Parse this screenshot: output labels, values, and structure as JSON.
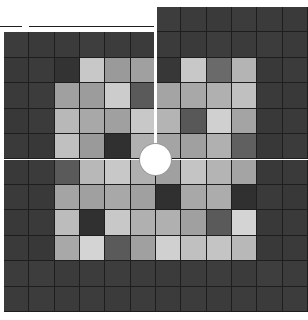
{
  "game": {
    "title": "Sliding tile grayscale puzzle",
    "grid": {
      "cols": 12,
      "rows": 12,
      "dark_color": "#3a3a3a",
      "cells": [
        [
          "#3b3b3b",
          "#3c3c3c",
          "#3a3a3a",
          "#3d3d3d",
          "#3b3b3b",
          "#3c3c3c",
          "#3d3d3d",
          "#3b3b3b",
          "#3a3a3a",
          "#3c3c3c",
          "#3b3b3b",
          "#3a3a3a"
        ],
        [
          "#3c3c3c",
          "#3a3a3a",
          "#3b3b3b",
          "#3e3e3e",
          "#3c3c3c",
          "#3b3b3b",
          "#3b3b3b",
          "#3a3a3a",
          "#3d3d3d",
          "#3b3b3b",
          "#3c3c3c",
          "#3a3a3a"
        ],
        [
          "#393939",
          "#3b3b3b",
          "#333333",
          "#c8c8c8",
          "#9a9a9a",
          "#a0a0a0",
          "#373737",
          "#c8c8c8",
          "#6a6a6a",
          "#b4b4b4",
          "#393939",
          "#3b3b3b"
        ],
        [
          "#3a3a3a",
          "#3c3c3c",
          "#a0a0a0",
          "#9c9c9c",
          "#cccccc",
          "#5a5a5a",
          "#a4a4a4",
          "#a8a8a8",
          "#b0b0b0",
          "#c0c0c0",
          "#3a3a3a",
          "#393939"
        ],
        [
          "#383838",
          "#3b3b3b",
          "#b8b8b8",
          "#a8a8a8",
          "#a0a0a0",
          "#c8c8c8",
          "#b4b4b4",
          "#585858",
          "#d0d0d0",
          "#a4a4a4",
          "#393939",
          "#3a3a3a"
        ],
        [
          "#3a3a3a",
          "#383838",
          "#c0c0c0",
          "#9a9a9a",
          "#303030",
          "#b0b0b0",
          "#a4a4a4",
          "#a0a0a0",
          "#b0b0b0",
          "#606060",
          "#383838",
          "#3b3b3b"
        ],
        [
          "#393939",
          "#3b3b3b",
          "#5a5a5a",
          "#b8b8b8",
          "#c8c8c8",
          "#b0b0b0",
          "#a0a0a0",
          "#c4c4c4",
          "#b4b4b4",
          "#a4a4a4",
          "#393939",
          "#3a3a3a"
        ],
        [
          "#3a3a3a",
          "#393939",
          "#a4a4a4",
          "#a0a0a0",
          "#a8a8a8",
          "#a0a0a0",
          "#303030",
          "#a8a8a8",
          "#acacac",
          "#303030",
          "#3a3a3a",
          "#383838"
        ],
        [
          "#393939",
          "#3a3a3a",
          "#bcbcbc",
          "#303030",
          "#c8c8c8",
          "#b0b0b0",
          "#b0b0b0",
          "#a0a0a0",
          "#5a5a5a",
          "#d4d4d4",
          "#393939",
          "#3a3a3a"
        ],
        [
          "#3a3a3a",
          "#383838",
          "#a8a8a8",
          "#d4d4d4",
          "#5a5a5a",
          "#a0a0a0",
          "#d0d0d0",
          "#c0c0c0",
          "#c4c4c4",
          "#b8b8b8",
          "#393939",
          "#3a3a3a"
        ],
        [
          "#3c3c3c",
          "#3d3d3d",
          "#3b3b3b",
          "#3c3c3c",
          "#3d3d3d",
          "#3c3c3c",
          "#3b3b3b",
          "#3c3c3c",
          "#3d3d3d",
          "#3b3b3b",
          "#3e3e3e",
          "#3c3c3c"
        ],
        [
          "#3b3b3b",
          "#3c3c3c",
          "#3b3b3b",
          "#3c3c3c",
          "#3b3b3b",
          "#3c3c3c",
          "#3b3b3b",
          "#3c3c3c",
          "#3b3b3b",
          "#3c3c3c",
          "#3b3b3b",
          "#3c3c3c"
        ]
      ]
    },
    "detached_strip": {
      "cells": [
        "#3b3b3b",
        "#3c3c3c",
        "#3b3b3b",
        "#3d3d3d",
        "#3c3c3c",
        "#3b3b3b"
      ]
    },
    "knob": {
      "color": "#ffffff",
      "icon": "circle-knob"
    },
    "divider_color": "#ffffff"
  }
}
